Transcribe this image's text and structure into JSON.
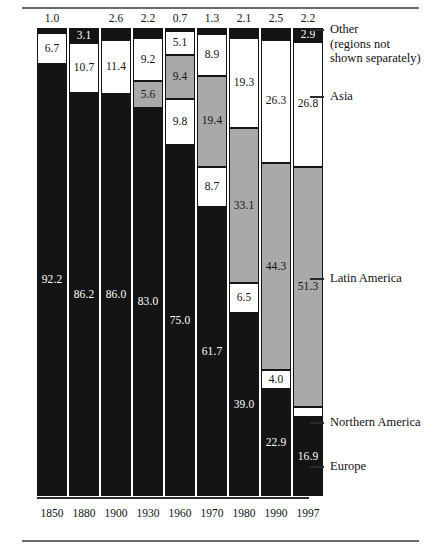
{
  "chart_data": {
    "type": "bar",
    "title": "",
    "subtitle": "",
    "xlabel": "",
    "ylabel": "",
    "ylim": [
      0,
      100
    ],
    "grid": false,
    "stacked": true,
    "legend_position": "right-callouts",
    "categories": [
      "1850",
      "1880",
      "1900",
      "1930",
      "1960",
      "1970",
      "1980",
      "1990",
      "1997"
    ],
    "series": [
      {
        "name": "Other (regions not shown separately)",
        "color": "#141414",
        "values": [
          1.0,
          3.1,
          2.6,
          2.2,
          0.7,
          1.3,
          2.1,
          2.5,
          2.9
        ]
      },
      {
        "name": "Asia",
        "color": "#ffffff",
        "values": [
          6.7,
          10.7,
          11.4,
          9.2,
          5.1,
          8.9,
          19.3,
          26.3,
          26.8
        ]
      },
      {
        "name": "Latin America",
        "color": "#a9a9a9",
        "values": [
          0.0,
          0.0,
          0.0,
          5.6,
          9.4,
          19.4,
          33.1,
          44.3,
          51.3
        ]
      },
      {
        "name": "Northern America",
        "color": "#ffffff",
        "values": [
          0.0,
          0.0,
          0.0,
          0.0,
          9.8,
          8.7,
          6.5,
          4.0,
          2.2
        ]
      },
      {
        "name": "Europe",
        "color": "#141414",
        "values": [
          92.2,
          86.2,
          86.0,
          83.0,
          75.0,
          61.7,
          39.0,
          22.9,
          16.9
        ]
      }
    ]
  },
  "axis": {
    "ticks": [
      "1850",
      "1880",
      "1900",
      "1930",
      "1960",
      "1970",
      "1980",
      "1990",
      "1997"
    ]
  },
  "callouts": {
    "other_line1": "Other",
    "other_line2": "(regions not",
    "other_line3": "shown separately)",
    "asia": "Asia",
    "latin_america": "Latin America",
    "northern_america": "Northern America",
    "europe": "Europe"
  },
  "bar_labels": {
    "b1850": {
      "other": "1.0",
      "asia": "6.7",
      "latin": "",
      "north": "",
      "europe": "92.2"
    },
    "b1880": {
      "other": "3.1",
      "asia": "10.7",
      "latin": "",
      "north": "",
      "europe": "86.2"
    },
    "b1900": {
      "other": "2.6",
      "asia": "11.4",
      "latin": "",
      "north": "",
      "europe": "86.0"
    },
    "b1930": {
      "other": "2.2",
      "asia": "9.2",
      "latin": "5.6",
      "north": "",
      "europe": "83.0"
    },
    "b1960": {
      "other": "0.7",
      "asia": "5.1",
      "latin": "9.4",
      "north": "9.8",
      "europe": "75.0"
    },
    "b1970": {
      "other": "1.3",
      "asia": "8.9",
      "latin": "19.4",
      "north": "8.7",
      "europe": "61.7"
    },
    "b1980": {
      "other": "2.1",
      "asia": "19.3",
      "latin": "33.1",
      "north": "6.5",
      "europe": "39.0"
    },
    "b1990": {
      "other": "2.5",
      "asia": "26.3",
      "latin": "44.3",
      "north": "4.0",
      "europe": "22.9"
    },
    "b1997": {
      "other": "2.9",
      "asia": "26.8",
      "latin": "51.3",
      "north": "2.2",
      "europe": "16.9"
    }
  }
}
